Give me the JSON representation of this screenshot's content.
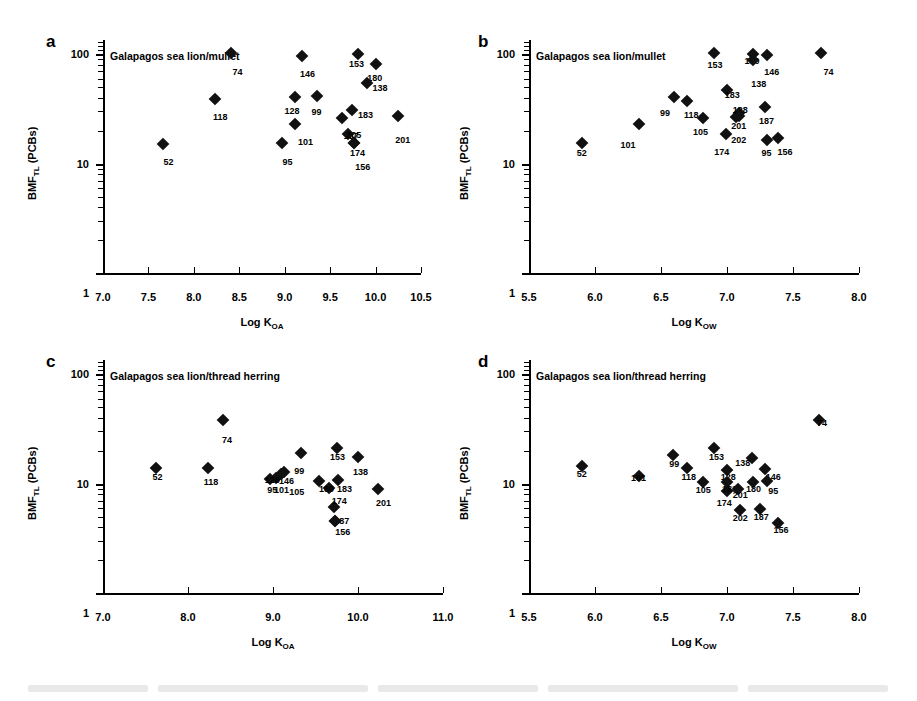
{
  "figure": {
    "marker_color": "#111111",
    "axis_color": "#000000",
    "background": "#ffffff"
  },
  "chart_data": [
    {
      "type": "scatter",
      "panel": "a",
      "title": "Galapagos sea lion/mullet",
      "xlabel": "Log K_OA",
      "xlabel_main": "Log K",
      "xlabel_sub": "OA",
      "ylabel_main": "BMF",
      "ylabel_sub": "TL",
      "ylabel_tail": " (PCBs)",
      "ylabel": "BMF_TL (PCBs)",
      "xlim": [
        7.0,
        10.5
      ],
      "xticks": [
        7.0,
        7.5,
        8.0,
        8.5,
        9.0,
        9.5,
        10.0,
        10.5
      ],
      "xticklabels": [
        "7.0",
        "7.5",
        "8.0",
        "8.5",
        "9.0",
        "9.5",
        "10.0",
        "10.5"
      ],
      "yscale": "log",
      "ylim": [
        1,
        135
      ],
      "yticks": [
        1,
        10,
        100
      ],
      "yticklabels": [
        "1",
        "10",
        "100"
      ],
      "grid": false,
      "legend": "none",
      "points": [
        {
          "label": "52",
          "x": 7.66,
          "y": 15.0,
          "lx": 7.72,
          "ly": 10.4
        },
        {
          "label": "118",
          "x": 8.23,
          "y": 39.0,
          "lx": 8.29,
          "ly": 26.5
        },
        {
          "label": "74",
          "x": 8.41,
          "y": 103.0,
          "lx": 8.48,
          "ly": 69.0
        },
        {
          "label": "95",
          "x": 8.97,
          "y": 15.5,
          "lx": 9.03,
          "ly": 10.4
        },
        {
          "label": "128",
          "x": 9.11,
          "y": 41.0,
          "lx": 9.08,
          "ly": 30.5
        },
        {
          "label": "101",
          "x": 9.11,
          "y": 23.0,
          "lx": 9.23,
          "ly": 15.8
        },
        {
          "label": "146",
          "x": 9.19,
          "y": 97.0,
          "lx": 9.25,
          "ly": 66.0
        },
        {
          "label": "99",
          "x": 9.35,
          "y": 41.5,
          "lx": 9.35,
          "ly": 29.5
        },
        {
          "label": "187",
          "x": 9.63,
          "y": 26.0,
          "lx": 9.73,
          "ly": 18.0
        },
        {
          "label": "183",
          "x": 9.74,
          "y": 31.0,
          "lx": 9.89,
          "ly": 28.0
        },
        {
          "label": "205",
          "x": 9.7,
          "y": 18.5,
          "lx": 9.76,
          "ly": 18.3
        },
        {
          "label": "153",
          "x": 9.81,
          "y": 101.0,
          "lx": 9.79,
          "ly": 82.0
        },
        {
          "label": "174",
          "x": 9.76,
          "y": 15.5,
          "lx": 9.8,
          "ly": 12.4
        },
        {
          "label": "156",
          "x": 9.76,
          "y": 15.4,
          "lx": 9.86,
          "ly": 9.4
        },
        {
          "label": "180",
          "x": 10.0,
          "y": 82.0,
          "lx": 9.99,
          "ly": 61.0
        },
        {
          "label": "138",
          "x": 9.91,
          "y": 55.0,
          "lx": 10.05,
          "ly": 49.0
        },
        {
          "label": "201",
          "x": 10.25,
          "y": 27.0,
          "lx": 10.3,
          "ly": 16.5
        }
      ]
    },
    {
      "type": "scatter",
      "panel": "b",
      "title": "Galapagos sea lion/mullet",
      "xlabel": "Log K_OW",
      "xlabel_main": "Log K",
      "xlabel_sub": "OW",
      "ylabel_main": "BMF",
      "ylabel_sub": "TL",
      "ylabel_tail": " (PCBs)",
      "ylabel": "BMF_TL (PCBs)",
      "xlim": [
        5.5,
        8.0
      ],
      "xticks": [
        5.5,
        6.0,
        6.5,
        7.0,
        7.5,
        8.0
      ],
      "xticklabels": [
        "5.5",
        "6.0",
        "6.5",
        "7.0",
        "7.5",
        "8.0"
      ],
      "yscale": "log",
      "ylim": [
        1,
        135
      ],
      "yticks": [
        1,
        10,
        100
      ],
      "yticklabels": [
        "1",
        "10",
        "100"
      ],
      "grid": false,
      "legend": "none",
      "points": [
        {
          "label": "52",
          "x": 5.9,
          "y": 15.5,
          "lx": 5.9,
          "ly": 12.6
        },
        {
          "label": "101",
          "x": 6.33,
          "y": 23.0,
          "lx": 6.25,
          "ly": 14.8
        },
        {
          "label": "99",
          "x": 6.6,
          "y": 41.0,
          "lx": 6.53,
          "ly": 29.0
        },
        {
          "label": "118",
          "x": 6.7,
          "y": 37.0,
          "lx": 6.73,
          "ly": 28.0
        },
        {
          "label": "105",
          "x": 6.82,
          "y": 26.0,
          "lx": 6.8,
          "ly": 19.6
        },
        {
          "label": "153",
          "x": 6.9,
          "y": 103.0,
          "lx": 6.91,
          "ly": 80.0
        },
        {
          "label": "174",
          "x": 6.99,
          "y": 18.5,
          "lx": 6.96,
          "ly": 12.8
        },
        {
          "label": "183",
          "x": 7.0,
          "y": 47.0,
          "lx": 7.04,
          "ly": 42.0
        },
        {
          "label": "202",
          "x": 7.07,
          "y": 26.5,
          "lx": 7.09,
          "ly": 16.6
        },
        {
          "label": "128",
          "x": 7.09,
          "y": 29.0,
          "lx": 7.1,
          "ly": 31.0
        },
        {
          "label": "201",
          "x": 7.09,
          "y": 27.0,
          "lx": 7.09,
          "ly": 22.0
        },
        {
          "label": "180",
          "x": 7.2,
          "y": 101.0,
          "lx": 7.19,
          "ly": 86.0
        },
        {
          "label": "138",
          "x": 7.2,
          "y": 89.0,
          "lx": 7.24,
          "ly": 54.0
        },
        {
          "label": "187",
          "x": 7.29,
          "y": 33.0,
          "lx": 7.3,
          "ly": 24.5
        },
        {
          "label": "146",
          "x": 7.3,
          "y": 98.0,
          "lx": 7.34,
          "ly": 69.0
        },
        {
          "label": "95",
          "x": 7.3,
          "y": 16.5,
          "lx": 7.3,
          "ly": 12.6
        },
        {
          "label": "156",
          "x": 7.39,
          "y": 17.0,
          "lx": 7.44,
          "ly": 12.8
        },
        {
          "label": "74",
          "x": 7.71,
          "y": 102.0,
          "lx": 7.77,
          "ly": 69.0
        }
      ]
    },
    {
      "type": "scatter",
      "panel": "c",
      "title": "Galapagos sea lion/thread herring",
      "xlabel": "Log K_OA",
      "xlabel_main": "Log K",
      "xlabel_sub": "OA",
      "ylabel_main": "BMF",
      "ylabel_sub": "TL",
      "ylabel_tail": " (PCBs)",
      "ylabel": "BMF_TL (PCBs)",
      "xlim": [
        7.0,
        11.0
      ],
      "xticks": [
        7.0,
        8.0,
        9.0,
        10.0,
        11.0
      ],
      "xticklabels": [
        "7.0",
        "8.0",
        "9.0",
        "10.0",
        "11.0"
      ],
      "yscale": "log",
      "ylim": [
        1,
        135
      ],
      "yticks": [
        1,
        10,
        100
      ],
      "yticklabels": [
        "1",
        "10",
        "100"
      ],
      "grid": false,
      "legend": "none",
      "points": [
        {
          "label": "52",
          "x": 7.62,
          "y": 14.0,
          "lx": 7.64,
          "ly": 11.6
        },
        {
          "label": "118",
          "x": 8.23,
          "y": 14.0,
          "lx": 8.27,
          "ly": 10.4
        },
        {
          "label": "74",
          "x": 8.41,
          "y": 38.0,
          "lx": 8.46,
          "ly": 25.0
        },
        {
          "label": "95",
          "x": 8.97,
          "y": 11.0,
          "lx": 8.99,
          "ly": 8.7
        },
        {
          "label": "101",
          "x": 9.04,
          "y": 11.3,
          "lx": 9.1,
          "ly": 8.7
        },
        {
          "label": "146",
          "x": 9.13,
          "y": 12.7,
          "lx": 9.16,
          "ly": 10.5
        },
        {
          "label": "128",
          "x": 9.09,
          "y": 12.2,
          "lx": 8.99,
          "ly": 10.9
        },
        {
          "label": "99",
          "x": 9.33,
          "y": 19.0,
          "lx": 9.31,
          "ly": 13.1
        },
        {
          "label": "105",
          "x": 9.54,
          "y": 10.5,
          "lx": 9.28,
          "ly": 8.3
        },
        {
          "label": "180",
          "x": 9.66,
          "y": 9.1,
          "lx": 9.63,
          "ly": 9.0
        },
        {
          "label": "183",
          "x": 9.77,
          "y": 10.8,
          "lx": 9.84,
          "ly": 8.9
        },
        {
          "label": "153",
          "x": 9.75,
          "y": 21.0,
          "lx": 9.76,
          "ly": 17.6
        },
        {
          "label": "138",
          "x": 10.0,
          "y": 17.5,
          "lx": 10.03,
          "ly": 12.7
        },
        {
          "label": "174",
          "x": 9.72,
          "y": 6.1,
          "lx": 9.78,
          "ly": 6.9
        },
        {
          "label": "187",
          "x": 9.73,
          "y": 4.6,
          "lx": 9.81,
          "ly": 4.6
        },
        {
          "label": "156",
          "x": 9.73,
          "y": 4.6,
          "lx": 9.82,
          "ly": 3.6
        },
        {
          "label": "201",
          "x": 10.24,
          "y": 8.9,
          "lx": 10.3,
          "ly": 6.6
        }
      ]
    },
    {
      "type": "scatter",
      "panel": "d",
      "title": "Galapagos sea lion/thread herring",
      "xlabel": "Log K_OW",
      "xlabel_main": "Log K",
      "xlabel_sub": "OW",
      "ylabel_main": "BMF",
      "ylabel_sub": "TL",
      "ylabel_tail": " (PCBs)",
      "ylabel": "BMF_TL (PCBs)",
      "xlim": [
        5.5,
        8.0
      ],
      "xticks": [
        5.5,
        6.0,
        6.5,
        7.0,
        7.5,
        8.0
      ],
      "xticklabels": [
        "5.5",
        "6.0",
        "6.5",
        "7.0",
        "7.5",
        "8.0"
      ],
      "yscale": "log",
      "ylim": [
        1,
        135
      ],
      "yticks": [
        1,
        10,
        100
      ],
      "yticklabels": [
        "1",
        "10",
        "100"
      ],
      "grid": false,
      "legend": "none",
      "points": [
        {
          "label": "52",
          "x": 5.9,
          "y": 14.4,
          "lx": 5.9,
          "ly": 12.2
        },
        {
          "label": "101",
          "x": 6.33,
          "y": 11.8,
          "lx": 6.33,
          "ly": 11.2
        },
        {
          "label": "99",
          "x": 6.59,
          "y": 18.4,
          "lx": 6.6,
          "ly": 15.1
        },
        {
          "label": "118",
          "x": 6.7,
          "y": 13.8,
          "lx": 6.71,
          "ly": 11.4
        },
        {
          "label": "105",
          "x": 6.82,
          "y": 10.4,
          "lx": 6.82,
          "ly": 8.7
        },
        {
          "label": "153",
          "x": 6.9,
          "y": 21.0,
          "lx": 6.92,
          "ly": 17.6
        },
        {
          "label": "174",
          "x": 7.0,
          "y": 8.5,
          "lx": 6.98,
          "ly": 6.6
        },
        {
          "label": "128",
          "x": 7.0,
          "y": 13.2,
          "lx": 7.01,
          "ly": 11.5
        },
        {
          "label": "183",
          "x": 7.0,
          "y": 10.4,
          "lx": 7.02,
          "ly": 9.0
        },
        {
          "label": "201",
          "x": 7.08,
          "y": 8.9,
          "lx": 7.1,
          "ly": 7.9
        },
        {
          "label": "138",
          "x": 7.19,
          "y": 17.0,
          "lx": 7.12,
          "ly": 15.3
        },
        {
          "label": "202",
          "x": 7.1,
          "y": 5.7,
          "lx": 7.1,
          "ly": 4.9
        },
        {
          "label": "180",
          "x": 7.2,
          "y": 10.4,
          "lx": 7.2,
          "ly": 8.9
        },
        {
          "label": "187",
          "x": 7.25,
          "y": 5.9,
          "lx": 7.26,
          "ly": 5.0
        },
        {
          "label": "146",
          "x": 7.29,
          "y": 13.6,
          "lx": 7.35,
          "ly": 11.4
        },
        {
          "label": "95",
          "x": 7.3,
          "y": 10.6,
          "lx": 7.35,
          "ly": 8.6
        },
        {
          "label": "156",
          "x": 7.39,
          "y": 4.4,
          "lx": 7.41,
          "ly": 3.8
        },
        {
          "label": "74",
          "x": 7.7,
          "y": 38.0,
          "lx": 7.72,
          "ly": 36.0
        }
      ]
    }
  ]
}
